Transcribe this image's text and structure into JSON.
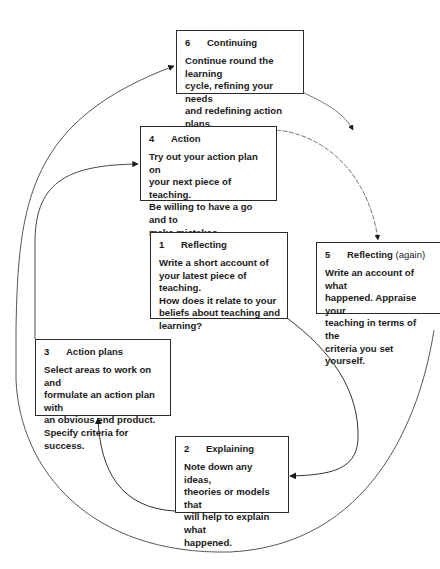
{
  "diagram": {
    "type": "cycle",
    "stages": [
      {
        "number": "1",
        "title": "Reflecting",
        "title_suffix": "",
        "text": "Write a short account of\nyour latest piece of teaching.\nHow does it relate to your\nbeliefs about teaching and\nlearning?"
      },
      {
        "number": "2",
        "title": "Explaining",
        "title_suffix": "",
        "text": "Note down any ideas,\ntheories or models that\nwill help to explain what\nhappened."
      },
      {
        "number": "3",
        "title": "Action plans",
        "title_suffix": "",
        "text": "Select areas to work on and\nformulate an action plan with\nan obvious end product.\nSpecify criteria for success."
      },
      {
        "number": "4",
        "title": "Action",
        "title_suffix": "",
        "text": "Try out your action plan on\nyour next piece of teaching.\nBe willing to have a go and to\nmake mistakes."
      },
      {
        "number": "5",
        "title": "Reflecting",
        "title_suffix": "(again)",
        "text": "Write an account of what\nhappened.  Appraise your\nteaching in terms of the\ncriteria you set yourself."
      },
      {
        "number": "6",
        "title": "Continuing",
        "title_suffix": "",
        "text": "Continue round the learning\ncycle, refining your needs\nand redefining action plans."
      }
    ],
    "connections": [
      {
        "from": "1",
        "to": "2"
      },
      {
        "from": "2",
        "to": "3"
      },
      {
        "from": "3",
        "to": "4"
      },
      {
        "from": "4",
        "to": "5"
      },
      {
        "from": "5",
        "to": "6"
      },
      {
        "from": "6",
        "to": "continue"
      }
    ],
    "colors": {
      "line": "#2a2a2a",
      "background": "#ffffff"
    }
  }
}
